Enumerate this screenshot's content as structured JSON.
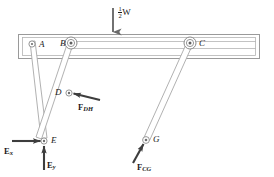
{
  "figure": {
    "type": "free-body-diagram",
    "background_color": "#ffffff",
    "line_color": "#8f8f8f",
    "outline_color": "#6e6e6e",
    "arrow_color": "#3d3d3d",
    "text_color": "#1a1a1a"
  },
  "load": {
    "name": "half-weight-load",
    "numerator": "1",
    "denominator": "2",
    "symbol": "W",
    "full_label": "1/2 W",
    "direction": "down"
  },
  "joints": [
    {
      "id": "A",
      "label": "A",
      "x": 32,
      "y": 44,
      "type": "pin-small"
    },
    {
      "id": "B",
      "label": "B",
      "x": 71,
      "y": 43,
      "type": "pin-large"
    },
    {
      "id": "C",
      "label": "C",
      "x": 190,
      "y": 43,
      "type": "pin-large"
    },
    {
      "id": "D",
      "label": "D",
      "x": 69,
      "y": 93,
      "type": "pin-small"
    },
    {
      "id": "E",
      "label": "E",
      "x": 44,
      "y": 141,
      "type": "pin-small"
    },
    {
      "id": "G",
      "label": "G",
      "x": 146,
      "y": 140,
      "type": "pin-small"
    }
  ],
  "forces": [
    {
      "id": "F_DH",
      "base": "F",
      "subscript": "DH",
      "subscript_style": "italic",
      "applied_at": "D",
      "direction": "left-up",
      "label_x": 78,
      "label_y": 101
    },
    {
      "id": "E_x",
      "base": "E",
      "subscript": "x",
      "subscript_style": "italic",
      "applied_at": "E",
      "direction": "right",
      "label_x": 4,
      "label_y": 139
    },
    {
      "id": "E_y",
      "base": "E",
      "subscript": "y",
      "subscript_style": "italic",
      "applied_at": "E",
      "direction": "up",
      "label_x": 45,
      "label_y": 159
    },
    {
      "id": "F_CG",
      "base": "F",
      "subscript": "CG",
      "subscript_style": "italic",
      "applied_at": "G",
      "direction": "right-up",
      "label_x": 137,
      "label_y": 162
    }
  ],
  "beam": {
    "name": "horizontal-beam",
    "outer": {
      "x": 18,
      "y": 34,
      "width": 242,
      "height": 25
    },
    "inner": {
      "x": 22,
      "y": 37,
      "width": 234,
      "height": 19
    }
  },
  "members": [
    {
      "id": "AE",
      "from": "A",
      "to": "E",
      "note": "link from A down to E"
    },
    {
      "id": "BD",
      "from": "B",
      "to": "D",
      "note": "link from B down to D crossing AE"
    },
    {
      "id": "CG",
      "from": "C",
      "to": "G",
      "note": "long link from C down to G"
    }
  ]
}
